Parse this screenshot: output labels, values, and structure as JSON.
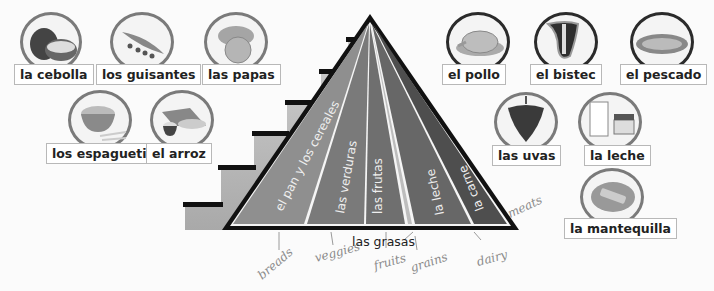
{
  "foods_left": [
    {
      "id": "la-cebolla",
      "label": "la cebolla",
      "icon": "onion-icon"
    },
    {
      "id": "los-guisantes",
      "label": "los guisantes",
      "icon": "peas-icon"
    },
    {
      "id": "las-papas",
      "label": "las papas",
      "icon": "potatoes-icon"
    },
    {
      "id": "los-espaguetis",
      "label": "los espaguetis",
      "icon": "spaghetti-icon"
    },
    {
      "id": "el-arroz",
      "label": "el arroz",
      "icon": "rice-icon"
    }
  ],
  "foods_right": [
    {
      "id": "el-pollo",
      "label": "el pollo",
      "icon": "chicken-icon"
    },
    {
      "id": "el-bistec",
      "label": "el bistec",
      "icon": "steak-icon"
    },
    {
      "id": "el-pescado",
      "label": "el pescado",
      "icon": "fish-icon"
    },
    {
      "id": "las-uvas",
      "label": "las uvas",
      "icon": "grapes-icon"
    },
    {
      "id": "la-leche",
      "label": "la leche",
      "icon": "milk-icon"
    },
    {
      "id": "la-mantequilla",
      "label": "la mantequilla",
      "icon": "butter-icon"
    }
  ],
  "pyramid": {
    "sections": [
      {
        "label": "el pan y los cereales",
        "color": "#8f8f8f"
      },
      {
        "label": "las verduras",
        "color": "#7a7a7a"
      },
      {
        "label": "las frutas",
        "color": "#6f6f6f"
      },
      {
        "label": "la leche",
        "color": "#6a6a6a"
      },
      {
        "label": "la carne",
        "color": "#505050"
      }
    ],
    "fats_label": "las grasas"
  },
  "handwritten": {
    "breads": "breads",
    "veggies": "veggies",
    "fruits": "fruits",
    "grains": "grains",
    "dairy": "dairy",
    "meats": "meats"
  }
}
